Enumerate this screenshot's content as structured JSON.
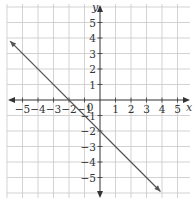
{
  "chart_data": {
    "type": "line",
    "title": "",
    "xlabel": "x",
    "ylabel": "y",
    "xlim": [
      -5.8,
      5.8
    ],
    "ylim": [
      -6,
      6
    ],
    "grid": true,
    "x_ticks": [
      "-5",
      "-4",
      "-3",
      "-2",
      "-1",
      "1",
      "2",
      "3",
      "4",
      "5"
    ],
    "y_ticks": [
      "5",
      "4",
      "3",
      "2",
      "1",
      "-1",
      "-2",
      "-3",
      "-4",
      "-5"
    ],
    "origin_label": "0",
    "series": [
      {
        "name": "y = -x - 2",
        "equation": "y = -x - 2",
        "x": [
          -5.8,
          -2,
          0,
          3.9
        ],
        "y": [
          3.8,
          0,
          -2,
          -5.9
        ],
        "arrows": "both",
        "color": "#555555"
      }
    ],
    "intercepts": {
      "x_intercept": -2,
      "y_intercept": -2
    }
  },
  "colors": {
    "grid": "#c8c8c8",
    "axis": "#333333",
    "line": "#555555"
  }
}
